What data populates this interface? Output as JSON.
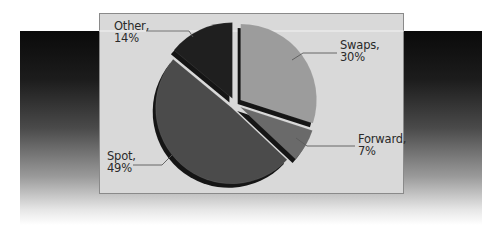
{
  "chart_data": {
    "type": "pie",
    "title": "",
    "style": "3d-exploded",
    "categories": [
      "Swaps",
      "Forward",
      "Spot",
      "Other"
    ],
    "values": [
      30,
      7,
      49,
      14
    ],
    "unit": "%",
    "start_angle_deg": 0,
    "direction": "clockwise",
    "colors": [
      "#9c9c9c",
      "#6a6a6a",
      "#4b4b4b",
      "#1f1f1f"
    ],
    "labels": [
      {
        "name": "Swaps",
        "pct": "30%",
        "text_line1": "Swaps,",
        "text_line2": "30%"
      },
      {
        "name": "Forward",
        "pct": "7%",
        "text_line1": "Forward,",
        "text_line2": "7%"
      },
      {
        "name": "Spot",
        "pct": "49%",
        "text_line1": "Spot,",
        "text_line2": "49%"
      },
      {
        "name": "Other",
        "pct": "14%",
        "text_line1": "Other,",
        "text_line2": "14%"
      }
    ],
    "legend": "none (leader-line labels)",
    "panel_background": "#d9d9d9",
    "backdrop_gradient": [
      "#0a0a0a",
      "#ffffff"
    ]
  }
}
